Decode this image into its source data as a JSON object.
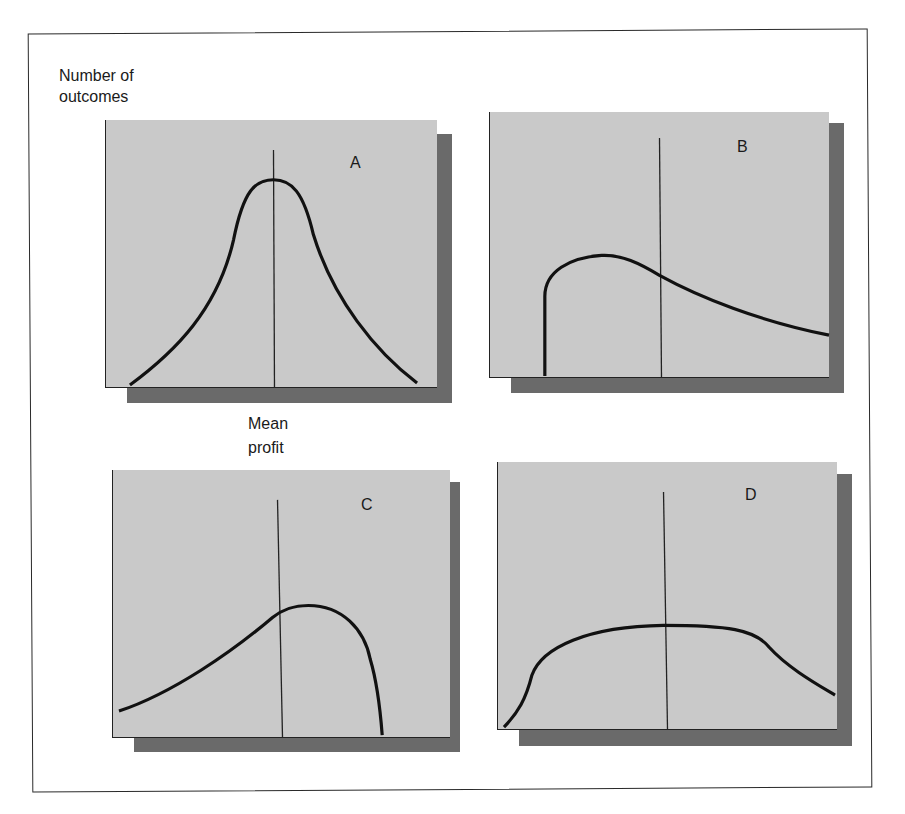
{
  "figure": {
    "y_axis_label_line1": "Number of",
    "y_axis_label_line2": "outcomes",
    "mean_label_line1": "Mean",
    "mean_label_line2": "profit"
  },
  "panels": [
    {
      "id": "A",
      "label": "A",
      "shape": "symmetric bell-shaped distribution centered on mean"
    },
    {
      "id": "B",
      "label": "B",
      "shape": "right-skewed distribution with sharp cutoff on left, long right tail"
    },
    {
      "id": "C",
      "label": "C",
      "shape": "left-skewed distribution with long left tail, sharp drop on right"
    },
    {
      "id": "D",
      "label": "D",
      "shape": "flat, wide distribution with broad plateau around mean"
    }
  ],
  "colors": {
    "plot_background": "#c9c9c9",
    "shadow": "#6a6a6a",
    "curve": "#111111",
    "frame": "#2a2a2a"
  }
}
